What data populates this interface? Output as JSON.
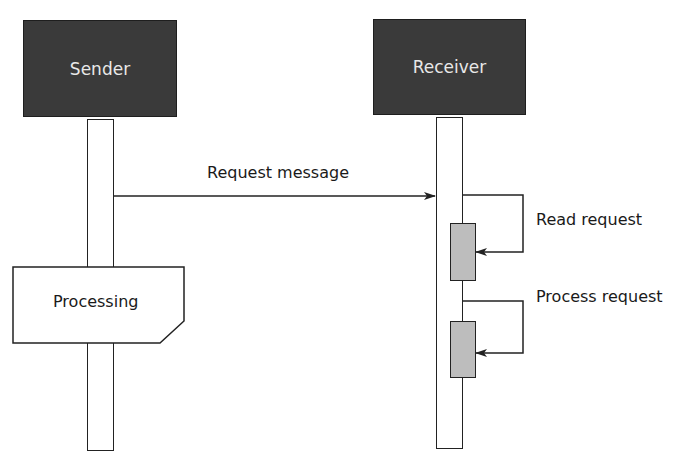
{
  "diagram": {
    "type": "sequence",
    "participants": [
      {
        "id": "sender",
        "label": "Sender"
      },
      {
        "id": "receiver",
        "label": "Receiver"
      }
    ],
    "messages": [
      {
        "from": "sender",
        "to": "receiver",
        "label": "Request message"
      },
      {
        "from": "receiver",
        "to": "receiver",
        "label": "Read request"
      },
      {
        "from": "receiver",
        "to": "receiver",
        "label": "Process request"
      }
    ],
    "notes": [
      {
        "on": "sender",
        "label": "Processing"
      }
    ],
    "colors": {
      "actor_fill": "#3a3a3a",
      "actor_text": "#e8e8e8",
      "activation_fill": "#bdbdbd",
      "line": "#222222"
    }
  }
}
